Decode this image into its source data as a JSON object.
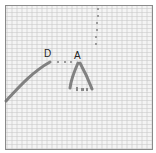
{
  "figure": {
    "labels": [
      {
        "id": "D",
        "text": "D"
      },
      {
        "id": "A",
        "text": "A"
      }
    ],
    "colors": {
      "background": "#f4f4f4",
      "stitch": "#6e6e6e",
      "border": "#8a8a8a"
    }
  }
}
